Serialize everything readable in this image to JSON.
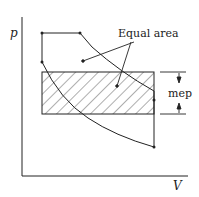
{
  "diagram": {
    "type": "p-V diagram (mean effective pressure)",
    "axes": {
      "y_label": "p",
      "x_label": "V"
    },
    "annotations": {
      "equal_area": "Equal area",
      "mep": "mep"
    },
    "colors": {
      "line": "#222222",
      "background": "#ffffff"
    }
  }
}
